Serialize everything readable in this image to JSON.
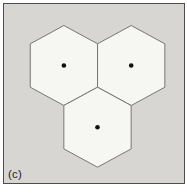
{
  "figure": {
    "label": "(c)"
  },
  "diagram": {
    "type": "hexagon-cluster",
    "hex_half_width": 33.65,
    "hex_apex_half_height": 40,
    "hex_side_half_height": 21.7,
    "dot_radius": 2.3,
    "hexagons": [
      {
        "name": "hex-top-left",
        "cx": 59.9,
        "cy": 61.5,
        "dot": true
      },
      {
        "name": "hex-top-right",
        "cx": 127.2,
        "cy": 61.5,
        "dot": true
      },
      {
        "name": "hex-bottom-center",
        "cx": 93.5,
        "cy": 123.2,
        "dot": true
      }
    ],
    "colors": {
      "page_background": "#ffffff",
      "panel_background": "#d7d6d2",
      "panel_border": "#4c4c4c",
      "hex_fill": "#f6f6f3",
      "hex_stroke": "#767676",
      "dot_color": "#111111",
      "label_color": "#1c1c1c"
    }
  }
}
